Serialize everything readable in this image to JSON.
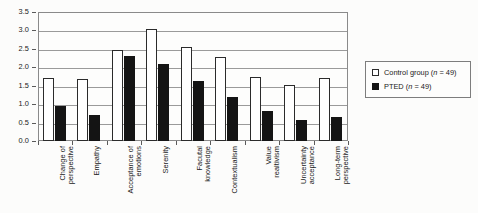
{
  "chart_data": {
    "type": "bar",
    "title": "",
    "xlabel": "",
    "ylabel": "",
    "ylim": [
      0.0,
      3.5
    ],
    "ytick_step": 0.5,
    "grid": true,
    "legend_position": "right",
    "categories": [
      "Change of perspective",
      "Empathy",
      "Acceptance of emotions",
      "Serenity",
      "Facutal knowledge",
      "Contextualism",
      "Value realtivism",
      "Uncertainty acceptance",
      "Long-term perspective"
    ],
    "ytick_labels": [
      "0.0",
      "0.5",
      "1.0",
      "1.5",
      "2.0",
      "2.5",
      "3.0",
      "3.5"
    ],
    "ytick_values": [
      0.0,
      0.5,
      1.0,
      1.5,
      2.0,
      2.5,
      3.0,
      3.5
    ],
    "series": [
      {
        "name": "Control group (n = 49)",
        "color": "#ffffff",
        "values": [
          1.7,
          1.68,
          2.47,
          3.05,
          2.55,
          2.27,
          1.73,
          1.53,
          1.72
        ]
      },
      {
        "name": "PTED (n = 49)",
        "color": "#141414",
        "values": [
          0.95,
          0.71,
          2.32,
          2.1,
          1.63,
          1.2,
          0.82,
          0.57,
          0.65
        ]
      }
    ]
  },
  "legend": {
    "items": [
      {
        "label_prefix": "Control group (",
        "label_italic": "n",
        "label_suffix": " = 49)",
        "swatch": "open-square"
      },
      {
        "label_prefix": "PTED (",
        "label_italic": "n",
        "label_suffix": " = 49)",
        "swatch": "filled-square"
      }
    ]
  }
}
